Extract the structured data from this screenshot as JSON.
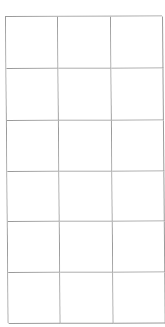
{
  "grid": {
    "rows": 6,
    "columns": 3,
    "line_color": "#9a9a9a",
    "background": "#ffffff",
    "cells": [
      [
        "",
        "",
        ""
      ],
      [
        "",
        "",
        ""
      ],
      [
        "",
        "",
        ""
      ],
      [
        "",
        "",
        ""
      ],
      [
        "",
        "",
        ""
      ],
      [
        "",
        "",
        ""
      ]
    ]
  }
}
